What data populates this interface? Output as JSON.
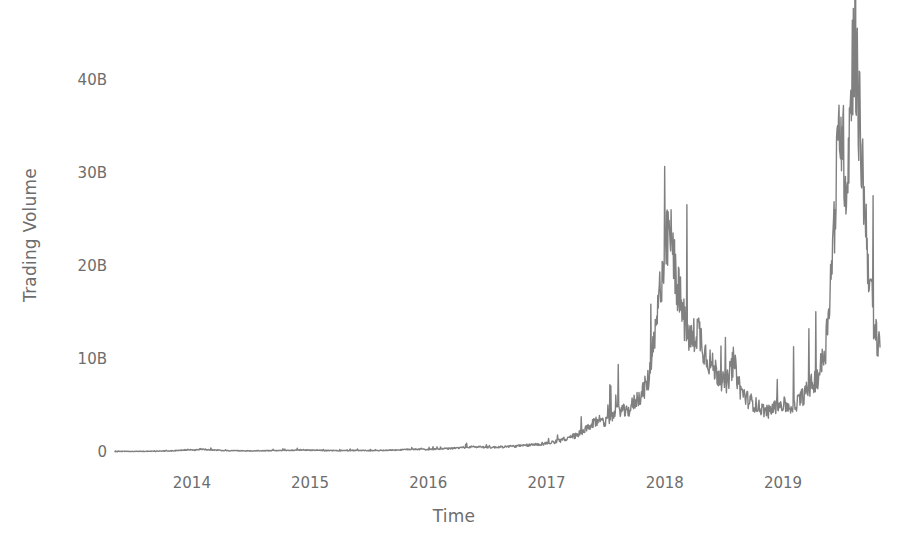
{
  "chart_data": {
    "type": "line",
    "title": "",
    "xlabel": "Time",
    "ylabel": "Trading Volume",
    "grid": false,
    "legend": null,
    "line_color": "#808080",
    "line_width": 1.4,
    "background": "#ffffff",
    "text_color": "#6d6d6d",
    "xlim": [
      2013.35,
      2019.82
    ],
    "ylim": [
      0,
      46000000000
    ],
    "y_ticks": [
      {
        "value": 0,
        "label": "0"
      },
      {
        "value": 10000000000,
        "label": "10B"
      },
      {
        "value": 20000000000,
        "label": "20B"
      },
      {
        "value": 30000000000,
        "label": "30B"
      },
      {
        "value": 40000000000,
        "label": "40B"
      }
    ],
    "x_ticks": [
      {
        "value": 2014,
        "label": "2014"
      },
      {
        "value": 2015,
        "label": "2015"
      },
      {
        "value": 2016,
        "label": "2016"
      },
      {
        "value": 2017,
        "label": "2017"
      },
      {
        "value": 2018,
        "label": "2018"
      },
      {
        "value": 2019,
        "label": "2019"
      }
    ],
    "units": "USD",
    "series": [
      {
        "name": "Trading Volume",
        "x": [
          2013.36,
          2013.42,
          2013.48,
          2013.54,
          2013.6,
          2013.66,
          2013.72,
          2013.78,
          2013.84,
          2013.9,
          2013.96,
          2014.02,
          2014.08,
          2014.14,
          2014.2,
          2014.26,
          2014.32,
          2014.38,
          2014.44,
          2014.5,
          2014.56,
          2014.62,
          2014.68,
          2014.74,
          2014.8,
          2014.86,
          2014.92,
          2014.98,
          2015.04,
          2015.1,
          2015.16,
          2015.22,
          2015.28,
          2015.34,
          2015.4,
          2015.46,
          2015.52,
          2015.58,
          2015.64,
          2015.7,
          2015.76,
          2015.82,
          2015.88,
          2015.94,
          2016.0,
          2016.06,
          2016.12,
          2016.18,
          2016.24,
          2016.3,
          2016.36,
          2016.42,
          2016.48,
          2016.54,
          2016.6,
          2016.66,
          2016.72,
          2016.78,
          2016.84,
          2016.9,
          2016.96,
          2017.02,
          2017.08,
          2017.14,
          2017.2,
          2017.26,
          2017.32,
          2017.38,
          2017.44,
          2017.5,
          2017.56,
          2017.62,
          2017.68,
          2017.74,
          2017.8,
          2017.86,
          2017.92,
          2017.98,
          2018.04,
          2018.1,
          2018.16,
          2018.22,
          2018.28,
          2018.34,
          2018.4,
          2018.46,
          2018.52,
          2018.58,
          2018.64,
          2018.7,
          2018.76,
          2018.82,
          2018.88,
          2018.94,
          2019.0,
          2019.06,
          2019.12,
          2019.18,
          2019.24,
          2019.3,
          2019.36,
          2019.42,
          2019.48,
          2019.54,
          2019.6,
          2019.66,
          2019.72,
          2019.78
        ],
        "values": [
          0.05,
          0.06,
          0.05,
          0.07,
          0.06,
          0.08,
          0.09,
          0.1,
          0.12,
          0.18,
          0.22,
          0.2,
          0.3,
          0.25,
          0.2,
          0.16,
          0.14,
          0.13,
          0.12,
          0.11,
          0.12,
          0.13,
          0.14,
          0.15,
          0.16,
          0.18,
          0.22,
          0.2,
          0.18,
          0.16,
          0.15,
          0.14,
          0.14,
          0.15,
          0.16,
          0.15,
          0.14,
          0.16,
          0.18,
          0.2,
          0.22,
          0.26,
          0.3,
          0.28,
          0.26,
          0.3,
          0.34,
          0.36,
          0.42,
          0.48,
          0.52,
          0.55,
          0.5,
          0.48,
          0.52,
          0.56,
          0.6,
          0.64,
          0.7,
          0.78,
          0.85,
          0.95,
          1.1,
          1.3,
          1.5,
          1.8,
          2.2,
          2.8,
          3.4,
          3.2,
          3.8,
          4.5,
          4.1,
          5.2,
          6.0,
          7.5,
          12.0,
          19.5,
          23.2,
          18.0,
          14.0,
          11.5,
          13.0,
          10.5,
          9.0,
          8.0,
          7.0,
          9.5,
          6.5,
          5.5,
          5.0,
          4.5,
          4.2,
          4.8,
          5.0,
          4.6,
          5.2,
          6.0,
          7.0,
          8.0,
          11.0,
          21.0,
          35.0,
          28.0,
          44.5,
          32.0,
          20.0,
          12.0
        ],
        "value_units": "billions USD"
      }
    ]
  },
  "axis": {
    "y_title": "Trading Volume",
    "x_title": "Time"
  }
}
